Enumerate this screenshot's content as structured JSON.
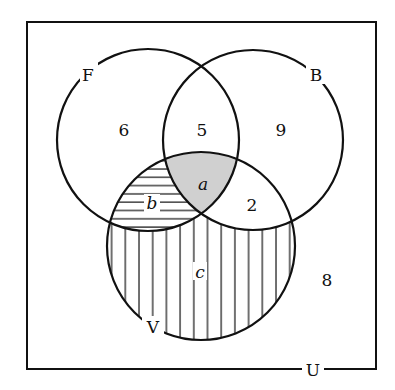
{
  "diagram": {
    "type": "venn",
    "universe_label": "U",
    "sets": [
      {
        "id": "F",
        "label": "F",
        "cx": 148,
        "cy": 140,
        "r": 91
      },
      {
        "id": "B",
        "label": "B",
        "cx": 253,
        "cy": 140,
        "r": 90
      },
      {
        "id": "V",
        "label": "V",
        "cx": 201,
        "cy": 246,
        "r": 94
      }
    ],
    "regions": {
      "F_only": "6",
      "F_and_B_only": "5",
      "B_only": "9",
      "F_B_V": "a",
      "F_and_V_only": "b",
      "B_and_V_only": "2",
      "V_only": "c",
      "outside": "8"
    },
    "shading": {
      "F_B_V": "gray fill",
      "F_and_V_only": "horizontal hatching",
      "V_only": "vertical hatching"
    },
    "colors": {
      "stroke": "#111111",
      "gray_fill": "#d0d0d0",
      "background": "#ffffff"
    }
  }
}
